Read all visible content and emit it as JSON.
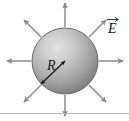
{
  "figure": {
    "type": "physics-diagram",
    "background_color": "#ffffff",
    "labels": {
      "radius": "R",
      "field": "E",
      "field_is_vector": true
    },
    "sphere": {
      "center_x": 65,
      "center_y": 61,
      "radius_px": 33,
      "fill_light": "#d8d8d8",
      "fill_mid": "#a8a8a8",
      "fill_dark": "#7a7a7a",
      "outline_color": "#5f5f5f",
      "highlight_x": 52,
      "highlight_y": 46
    },
    "radius_arrow": {
      "from_x": 40,
      "from_y": 84,
      "to_x": 65,
      "to_y": 61,
      "color": "#1a1a1a",
      "label": "R",
      "label_x": 49,
      "label_y": 67
    },
    "field_arrows": {
      "count": 8,
      "color": "#8c8c8c",
      "directions_deg": [
        0,
        45,
        90,
        135,
        180,
        225,
        270,
        315
      ],
      "start_radius": 34,
      "end_radius": 58
    },
    "field_label": {
      "text": "E",
      "x": 113,
      "y": 28
    },
    "divider": {
      "y": 113,
      "color": "#b9b9b9",
      "visible": true
    }
  }
}
